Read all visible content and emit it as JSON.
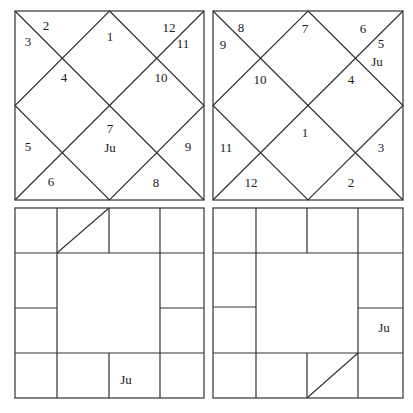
{
  "charts": [
    {
      "id": "north-chart-left",
      "style": "north-indian",
      "houses": [
        {
          "label": "1",
          "x": 95,
          "y": 25
        },
        {
          "label": "2",
          "x": 31,
          "y": 14
        },
        {
          "label": "3",
          "x": 13,
          "y": 30
        },
        {
          "label": "4",
          "x": 49,
          "y": 66
        },
        {
          "label": "5",
          "x": 13,
          "y": 135
        },
        {
          "label": "6",
          "x": 36,
          "y": 170
        },
        {
          "label": "7",
          "x": 95,
          "y": 117
        },
        {
          "label": "8",
          "x": 141,
          "y": 171
        },
        {
          "label": "9",
          "x": 173,
          "y": 135
        },
        {
          "label": "10",
          "x": 146,
          "y": 66
        },
        {
          "label": "11",
          "x": 168,
          "y": 32
        },
        {
          "label": "12",
          "x": 154,
          "y": 16
        }
      ],
      "planets": [
        {
          "label": "Ju",
          "x": 95,
          "y": 136
        }
      ]
    },
    {
      "id": "north-chart-right",
      "style": "north-indian",
      "houses": [
        {
          "label": "7",
          "x": 92,
          "y": 17
        },
        {
          "label": "8",
          "x": 28,
          "y": 16
        },
        {
          "label": "9",
          "x": 10,
          "y": 33
        },
        {
          "label": "10",
          "x": 47,
          "y": 68
        },
        {
          "label": "11",
          "x": 13,
          "y": 136
        },
        {
          "label": "12",
          "x": 38,
          "y": 171
        },
        {
          "label": "1",
          "x": 92,
          "y": 121
        },
        {
          "label": "2",
          "x": 138,
          "y": 171
        },
        {
          "label": "3",
          "x": 168,
          "y": 136
        },
        {
          "label": "4",
          "x": 138,
          "y": 68
        },
        {
          "label": "5",
          "x": 168,
          "y": 32
        },
        {
          "label": "6",
          "x": 150,
          "y": 17
        }
      ],
      "planets": [
        {
          "label": "Ju",
          "x": 164,
          "y": 50
        }
      ]
    },
    {
      "id": "south-chart-left",
      "style": "south-indian",
      "ascendant_cell": "row0-col1",
      "planets": [
        {
          "label": "Ju",
          "cell": "row3-col2",
          "x": 111,
          "y": 171
        }
      ]
    },
    {
      "id": "south-chart-right",
      "style": "south-indian",
      "ascendant_cell": "row3-col2",
      "planets": [
        {
          "label": "Ju",
          "cell": "row2-col3",
          "x": 171,
          "y": 119
        }
      ]
    }
  ],
  "colors": {
    "line": "#333333",
    "text": "#222222",
    "background": "#ffffff"
  }
}
